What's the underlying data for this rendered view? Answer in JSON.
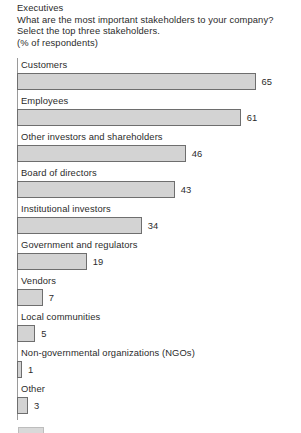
{
  "header": {
    "audience": "Executives",
    "question": "What are the most important stakeholders to your company?",
    "instruction": "Select the top three stakeholders.",
    "units": "(% of respondents)"
  },
  "colors": {
    "bar_fill": "#d3d3d3",
    "bar_border": "#6e6e6e",
    "axis": "#9a9a9a",
    "text": "#2b2b2b",
    "background": "#ffffff"
  },
  "chart_data": {
    "type": "bar",
    "orientation": "horizontal",
    "title": "What are the most important stakeholders to your company?",
    "subtitle": "Select the top three stakeholders.",
    "xlabel": "",
    "ylabel": "",
    "units": "% of respondents",
    "grid": false,
    "legend": false,
    "xlim": [
      0,
      65
    ],
    "categories": [
      "Customers",
      "Employees",
      "Other investors and shareholders",
      "Board of directors",
      "Institutional investors",
      "Government and regulators",
      "Vendors",
      "Local communities",
      "Non-governmental organizations (NGOs)",
      "Other"
    ],
    "values": [
      65,
      61,
      46,
      43,
      34,
      19,
      7,
      5,
      1,
      3
    ],
    "value_labels": [
      "65",
      "61",
      "46",
      "43",
      "34",
      "19",
      "7",
      "5",
      "1",
      "3"
    ]
  }
}
